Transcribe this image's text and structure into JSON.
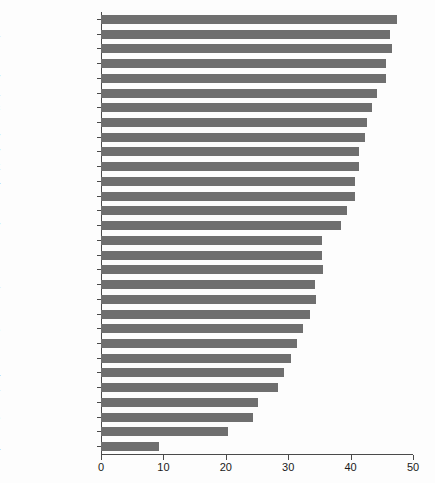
{
  "chart_data": {
    "type": "bar",
    "orientation": "horizontal",
    "title": "",
    "xlabel": "",
    "ylabel": "",
    "xlim": [
      0,
      50
    ],
    "ylim": null,
    "grid": false,
    "legend": null,
    "bar_color": "#6f6f6f",
    "xticks": [
      0,
      10,
      20,
      30,
      40,
      50
    ],
    "xtick_labels": [
      "0",
      "10",
      "20",
      "30",
      "40",
      "50"
    ],
    "categories": [
      "Ireland",
      "Slovenia",
      "Finland",
      "Belgium",
      "Hungary",
      "Austria",
      "Czech Republic",
      "Luxembourg",
      "Germany",
      "Norway",
      "Denmark",
      "Slovakia",
      "France",
      "Sweden",
      "Italy",
      "Poland",
      "Greece",
      "United Kingdom",
      "Estonia",
      "Portugal",
      "Spain",
      "Netherlands",
      "Japan",
      "New Zealand",
      "Australia",
      "Canada",
      "Israel",
      "United States",
      "Switzerland",
      "South Korea"
    ],
    "values": [
      47.4,
      46.3,
      46.6,
      45.6,
      45.6,
      44.3,
      43.5,
      42.7,
      42.3,
      41.3,
      41.3,
      40.7,
      40.7,
      39.4,
      38.4,
      35.4,
      35.4,
      35.6,
      34.3,
      34.4,
      33.5,
      32.4,
      31.4,
      30.4,
      29.3,
      28.4,
      25.1,
      24.4,
      20.4,
      9.3
    ]
  }
}
